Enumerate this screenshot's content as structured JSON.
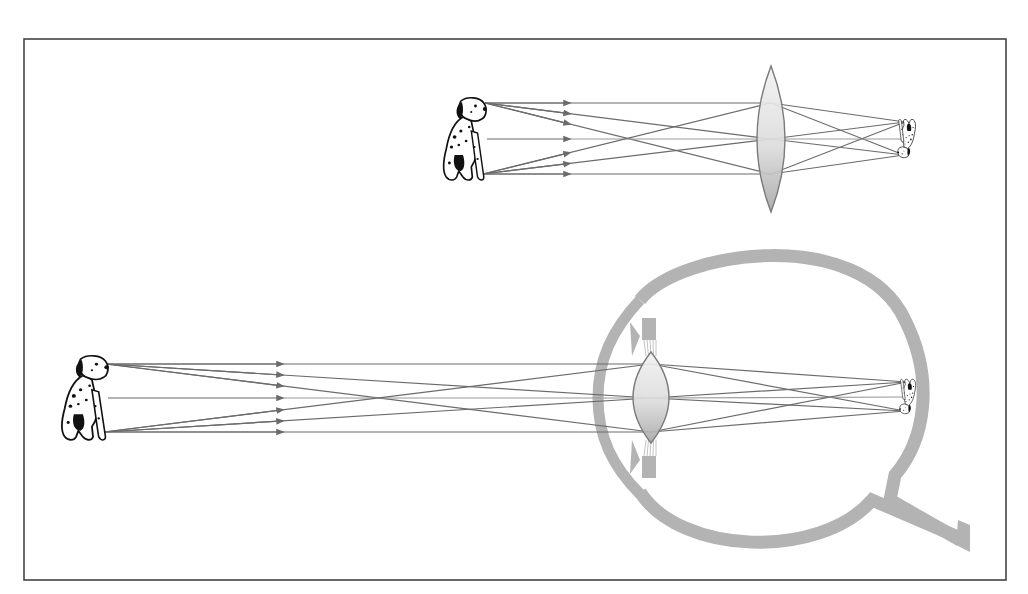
{
  "figure": {
    "frame": {
      "x": 24,
      "y": 39,
      "width": 982,
      "height": 541,
      "stroke": "#444444"
    },
    "colors": {
      "ray": "#6b6b6b",
      "ray_center": "#9a9a9a",
      "eye_tissue": "#b3b3b3",
      "lens_fill_top": "#f2f2f2",
      "lens_fill_bottom": "#a8a8a8",
      "lens_stroke": "#7a7a7a",
      "dog": "#111111"
    }
  },
  "panels": [
    {
      "id": "camera-lens",
      "label": "Convex lens forming an inverted image",
      "object": {
        "label": "Dalmatian (object)",
        "x": 440,
        "y": 97,
        "w": 48,
        "h": 86,
        "head": [
          485,
          103
        ],
        "feet": [
          483,
          174
        ],
        "mid": [
          487,
          139
        ]
      },
      "lens": {
        "cx": 771,
        "top": 66,
        "bottom": 212,
        "half_width": 14
      },
      "lens_hits": {
        "top": 103,
        "mid": 139,
        "bottom": 174
      },
      "image": {
        "label": "Inverted image",
        "x": 897,
        "y": 118,
        "w": 20,
        "h": 40,
        "top": [
          905,
          122
        ],
        "mid": [
          907,
          139
        ],
        "bottom": [
          904,
          155
        ]
      },
      "arrow_x": 570
    },
    {
      "id": "human-eye",
      "label": "Human eye forming an inverted image on the retina",
      "object": {
        "label": "Dalmatian (object)",
        "x": 58,
        "y": 355,
        "w": 52,
        "h": 88,
        "head": [
          106,
          364
        ],
        "feet": [
          104,
          432
        ],
        "mid": [
          108,
          398
        ]
      },
      "lens": {
        "cx": 651,
        "top": 352,
        "bottom": 443,
        "half_width": 18
      },
      "lens_hits": {
        "top": 364,
        "mid": 398,
        "bottom": 432
      },
      "image": {
        "label": "Inverted image on retina",
        "x": 899,
        "y": 378,
        "w": 18,
        "h": 36,
        "top": [
          907,
          382
        ],
        "mid": [
          909,
          397
        ],
        "bottom": [
          905,
          411
        ]
      },
      "arrow_x": 283,
      "eye": {
        "label": "Eyeball cross-section",
        "cx": 770,
        "cy": 396,
        "r": 147,
        "wall": 13
      }
    }
  ]
}
